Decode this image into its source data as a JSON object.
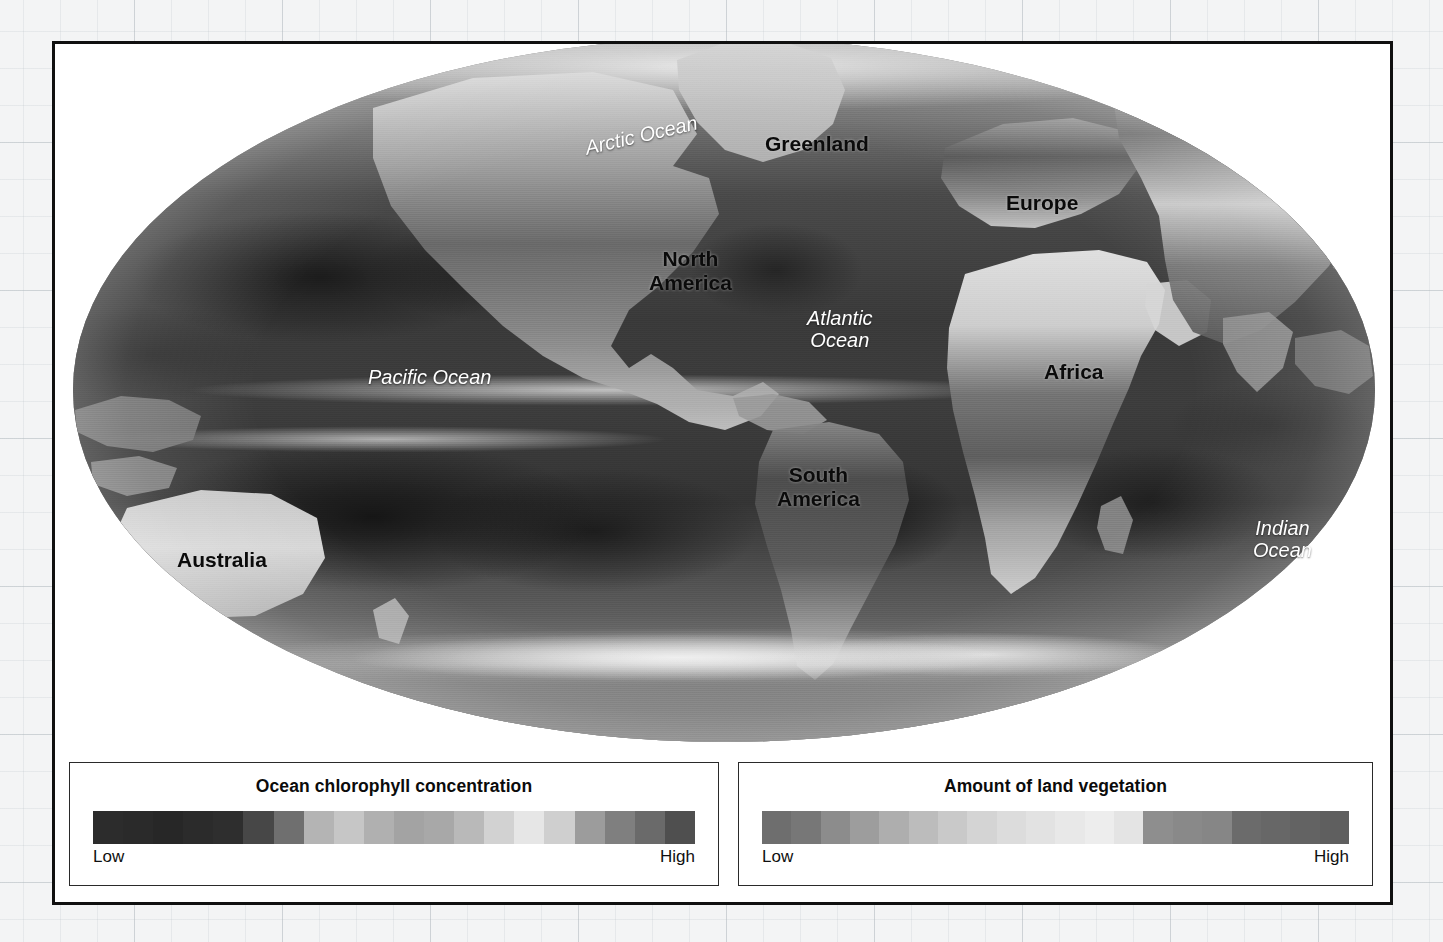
{
  "figure": {
    "type": "world-map",
    "projection": "Mollweide",
    "labels": [
      {
        "id": "arctic-ocean",
        "text": "Arctic Ocean",
        "kind": "ocean",
        "x": 529,
        "y": 80,
        "rotate": -13
      },
      {
        "id": "greenland",
        "text": "Greenland",
        "kind": "land",
        "x": 710,
        "y": 88,
        "rotate": 0
      },
      {
        "id": "europe",
        "text": "Europe",
        "kind": "land",
        "x": 951,
        "y": 147,
        "rotate": 0
      },
      {
        "id": "north-america",
        "text": "North\nAmerica",
        "kind": "land",
        "x": 594,
        "y": 203,
        "rotate": 0
      },
      {
        "id": "atlantic-ocean",
        "text": "Atlantic\nOcean",
        "kind": "ocean",
        "x": 752,
        "y": 263,
        "rotate": 0
      },
      {
        "id": "pacific-ocean",
        "text": "Pacific Ocean",
        "kind": "ocean",
        "x": 313,
        "y": 322,
        "rotate": 0
      },
      {
        "id": "africa",
        "text": "Africa",
        "kind": "land",
        "x": 989,
        "y": 316,
        "rotate": 0
      },
      {
        "id": "south-america",
        "text": "South\nAmerica",
        "kind": "land",
        "x": 722,
        "y": 419,
        "rotate": 0
      },
      {
        "id": "indian-ocean",
        "text": "Indian\nOcean",
        "kind": "ocean",
        "x": 1198,
        "y": 473,
        "rotate": 0
      },
      {
        "id": "australia",
        "text": "Australia",
        "kind": "land",
        "x": 122,
        "y": 504,
        "rotate": 0
      },
      {
        "id": "antarctica",
        "text": "Antarctica",
        "kind": "land",
        "x": 640,
        "y": 712,
        "rotate": 0
      }
    ]
  },
  "legends": [
    {
      "id": "ocean-chlorophyll",
      "title": "Ocean chlorophyll concentration",
      "low_label": "Low",
      "high_label": "High",
      "swatches": [
        "#2c2c2c",
        "#2a2a2a",
        "#272727",
        "#2b2b2b",
        "#2e2e2e",
        "#474747",
        "#6f6f6f",
        "#b4b4b4",
        "#c6c6c6",
        "#b0b0b0",
        "#a3a3a3",
        "#a8a8a8",
        "#b9b9b9",
        "#d2d2d2",
        "#e6e6e6",
        "#cfcfcf",
        "#9c9c9c",
        "#7f7f7f",
        "#6a6a6a",
        "#4f4f4f"
      ]
    },
    {
      "id": "land-vegetation",
      "title": "Amount of land vegetation",
      "low_label": "Low",
      "high_label": "High",
      "swatches": [
        "#6e6e6e",
        "#777777",
        "#8c8c8c",
        "#9d9d9d",
        "#aeaeae",
        "#bcbcbc",
        "#c9c9c9",
        "#d4d4d4",
        "#dcdcdc",
        "#e2e2e2",
        "#e8e8e8",
        "#ededed",
        "#e4e4e4",
        "#8e8e8e",
        "#898989",
        "#868686",
        "#6b6b6b",
        "#676767",
        "#636363",
        "#5f5f5f"
      ]
    }
  ],
  "chart_data": {
    "type": "heatmap",
    "projection": "Mollweide (equal-area world map)",
    "grid": false,
    "legend_position": "bottom",
    "xlabel": "",
    "ylabel": "",
    "series": [
      {
        "name": "Ocean chlorophyll concentration",
        "scale_min_label": "Low",
        "scale_max_label": "High",
        "n_swatches": 20
      },
      {
        "name": "Amount of land vegetation",
        "scale_min_label": "Low",
        "scale_max_label": "High",
        "n_swatches": 20
      }
    ],
    "annotations": [
      "Arctic Ocean",
      "Greenland",
      "Europe",
      "North America",
      "Atlantic Ocean",
      "Pacific Ocean",
      "Africa",
      "South America",
      "Indian Ocean",
      "Australia",
      "Antarctica"
    ]
  }
}
